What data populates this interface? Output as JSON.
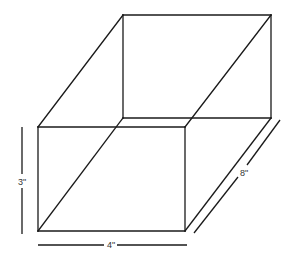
{
  "diagram": {
    "type": "rectangular prism (box) with dimensions",
    "shape": "rectangular-prism",
    "dimensions": {
      "height": "3\"",
      "width": "4\"",
      "depth": "8\""
    },
    "labels": {
      "height_label": "3\"",
      "width_label": "4\"",
      "depth_label": "8\""
    },
    "colors": {
      "line": "#1a1a1a",
      "text": "#333333",
      "background": "#ffffff"
    }
  }
}
